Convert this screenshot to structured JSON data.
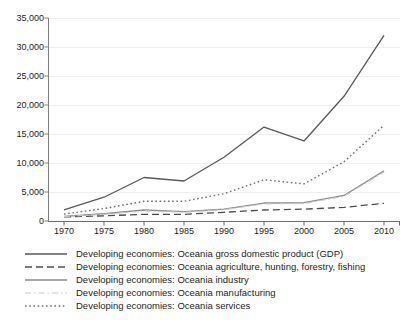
{
  "chart_data": {
    "type": "line",
    "title": "",
    "xlabel": "",
    "ylabel": "",
    "x": [
      1970,
      1975,
      1980,
      1985,
      1990,
      1995,
      2000,
      2005,
      2010
    ],
    "xlim": [
      1968,
      2012
    ],
    "ylim": [
      0,
      35000
    ],
    "y_ticks": [
      0,
      5000,
      10000,
      15000,
      20000,
      25000,
      30000,
      35000
    ],
    "y_tick_labels": [
      "0",
      "5,000",
      "10,000",
      "15,000",
      "20,000",
      "25,000",
      "30,000",
      "35,000"
    ],
    "x_tick_labels": [
      "1970",
      "1975",
      "1980",
      "1985",
      "1990",
      "1995",
      "2000",
      "2005",
      "2010"
    ],
    "grid": true,
    "legend_position": "below",
    "series": [
      {
        "name": "Developing economies: Oceania gross domestic product (GDP)",
        "style": "solid",
        "color": "#595959",
        "width": 1.3,
        "values": [
          1900,
          4100,
          7500,
          6900,
          11000,
          16200,
          13800,
          21500,
          32000
        ]
      },
      {
        "name": "Developing economies: Oceania agriculture, hunting, forestry, fishing",
        "style": "dashed",
        "color": "#4d4d4d",
        "width": 1.3,
        "values": [
          700,
          900,
          1150,
          1150,
          1500,
          1900,
          2050,
          2350,
          3050
        ]
      },
      {
        "name": "Developing economies: Oceania industry",
        "style": "solid",
        "color": "#8c8c8c",
        "width": 1.3,
        "values": [
          800,
          1250,
          1900,
          1600,
          2050,
          3100,
          3150,
          4400,
          8650
        ]
      },
      {
        "name": "Developing economies: Oceania manufacturing",
        "style": "dashdot",
        "color": "#c9c9c9",
        "width": 1.1,
        "values": [
          750,
          1150,
          1750,
          1500,
          1950,
          2950,
          3000,
          4250,
          8450
        ]
      },
      {
        "name": "Developing economies: Oceania services",
        "style": "dotted",
        "color": "#707070",
        "width": 1.4,
        "values": [
          1200,
          2150,
          3400,
          3400,
          4700,
          7100,
          6400,
          10200,
          16500
        ]
      }
    ]
  }
}
